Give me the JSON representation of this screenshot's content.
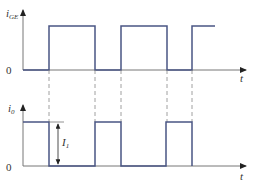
{
  "diagram": {
    "colors": {
      "waveform": "#4a5684",
      "axis": "#777777",
      "dashed": "#888888",
      "text": "#333333"
    },
    "top_plot": {
      "ylabel": "i",
      "ylabel_sub": "GE",
      "zero_label": "0",
      "xlabel": "t",
      "pulses": [
        [
          49,
          95
        ],
        [
          121,
          167
        ],
        [
          192,
          215
        ]
      ]
    },
    "bottom_plot": {
      "ylabel": "i",
      "ylabel_sub": "0",
      "zero_label": "0",
      "xlabel": "t",
      "pulses": [
        [
          23,
          49
        ],
        [
          95,
          121
        ],
        [
          166,
          192
        ]
      ],
      "amplitude_label": "I",
      "amplitude_sub": "1"
    },
    "dashed_x": [
      49,
      95,
      121,
      167,
      192
    ]
  }
}
